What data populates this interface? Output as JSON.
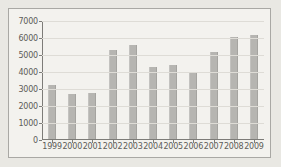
{
  "chart_data": {
    "type": "bar",
    "title": "",
    "xlabel": "",
    "ylabel": "",
    "categories": [
      "1999",
      "2000",
      "2001",
      "2002",
      "2003",
      "2004",
      "2005",
      "2006",
      "2007",
      "2008",
      "2009"
    ],
    "values": [
      3200,
      2650,
      2720,
      5250,
      5530,
      4230,
      4370,
      3930,
      5120,
      6000,
      6120
    ],
    "ylim": [
      0,
      7000
    ],
    "ytick_labels": [
      "0",
      "1000",
      "2000",
      "3000",
      "4000",
      "5000",
      "6000",
      "7000"
    ],
    "ytick_values": [
      0,
      1000,
      2000,
      3000,
      4000,
      5000,
      6000,
      7000
    ],
    "grid": true,
    "legend": "none",
    "bar_color": "#b6b5b1",
    "grid_color": "#dedcd6",
    "axis_color": "#7d7c78",
    "text_color": "#5d5c58",
    "plot_background": "#f3f2ee",
    "page_background": "#e9e8e3",
    "border_color": "#a9a8a4"
  }
}
